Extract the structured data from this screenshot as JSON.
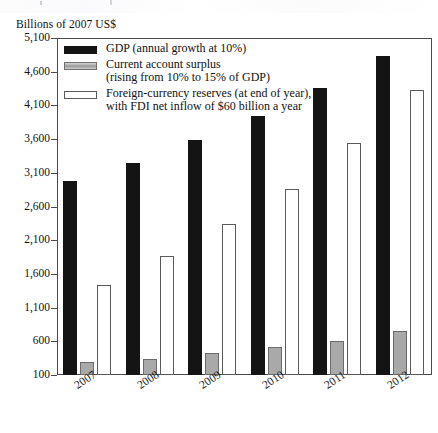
{
  "chart_data": {
    "type": "bar",
    "title": "",
    "subtitle": "",
    "axis_unit_label": "Billions of 2007 US$",
    "xlabel": "",
    "ylabel": "Billions of 2007 US$",
    "categories": [
      "2007",
      "2008",
      "2009",
      "2010",
      "2011",
      "2012"
    ],
    "ylim": [
      100,
      5100
    ],
    "yticks": [
      100,
      600,
      1100,
      1600,
      2100,
      2600,
      3100,
      3600,
      4100,
      4600,
      5100
    ],
    "ytick_labels": [
      "100",
      "600",
      "1,100",
      "1,600",
      "2,100",
      "2,600",
      "3,100",
      "3,600",
      "4,100",
      "4,600",
      "5,100"
    ],
    "grid": false,
    "legend_position": "top-left",
    "series": [
      {
        "name": "GDP (annual growth at 10%)",
        "key": "gdp",
        "color": "#141414",
        "values": [
          2980,
          3250,
          3580,
          3940,
          4360,
          4840
        ]
      },
      {
        "name": "Current account surplus (rising from 10% to 15% of GDP)",
        "key": "surplus",
        "color": "#a9a9a9",
        "values": [
          300,
          345,
          430,
          510,
          610,
          760
        ]
      },
      {
        "name": "Foreign-currency reserves (at end of year), with FDI net inflow of $60 billion a year",
        "key": "reserves",
        "color": "#ffffff",
        "values": [
          1430,
          1870,
          2340,
          2860,
          3540,
          4330
        ]
      }
    ]
  },
  "legend": {
    "items": [
      {
        "swatch": "gdp",
        "line1": "GDP (annual growth at 10%)",
        "line2": ""
      },
      {
        "swatch": "surplus",
        "line1": "Current account surplus",
        "line2": "(rising from 10% to 15% of GDP)"
      },
      {
        "swatch": "reserves",
        "line1": "Foreign-currency reserves (at end of year),",
        "line2": "with FDI net inflow of $60 billion a year"
      }
    ]
  }
}
